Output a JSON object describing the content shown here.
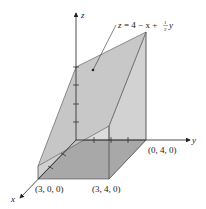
{
  "figure": {
    "type": "3d-solid-under-plane",
    "equation_label": "z = 4 − x + ½y",
    "equation_parts": {
      "lhs": "z",
      "rhs_main": "= 4 − x + ",
      "frac_num": "1",
      "frac_den": "2",
      "tail": "y"
    },
    "axes": {
      "x": "x",
      "y": "y",
      "z": "z"
    },
    "points": [
      {
        "label": "(3, 0, 0)",
        "coords": [
          3,
          0,
          0
        ]
      },
      {
        "label": "(3, 4, 0)",
        "coords": [
          3,
          4,
          0
        ]
      },
      {
        "label": "(0, 4, 0)",
        "coords": [
          0,
          4,
          0
        ]
      }
    ],
    "z_ticks": [
      1,
      2,
      3,
      4
    ],
    "y_ticks": [
      1,
      2,
      3,
      4
    ],
    "x_ticks": [
      1,
      2,
      3
    ],
    "colors": {
      "plane": "#c8c8c8",
      "side": "#d8d8d8",
      "base": "#a6a6a6",
      "line": "#333333"
    }
  }
}
